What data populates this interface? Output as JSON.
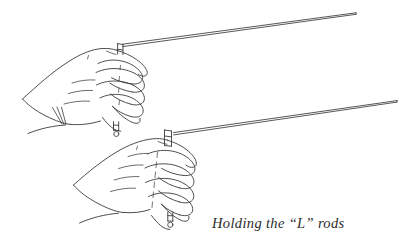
{
  "figure": {
    "caption": "Holding the “L” rods",
    "medium": "pen-and-ink line drawing",
    "background_color": "#ffffff",
    "ink_color": "#3a3a3a",
    "width": 419,
    "height": 250
  },
  "subjects": [
    {
      "name": "upper-hand",
      "description": "Left hand shown in profile, fingers curled into a loose fist gripping a vertical dowel handle; thumb hidden behind fingers, wrist and forearm exit to the lower left.",
      "grip": "closed fist, four fingers visible stacked vertically",
      "finger_count": 4
    },
    {
      "name": "lower-hand",
      "description": "Second hand below and to the right, also curled into a fist gripping a vertical dowel handle; four fingers visible, wrist exits to the lower left.",
      "grip": "closed fist, four fingers visible stacked vertically",
      "finger_count": 4
    }
  ],
  "objects": [
    {
      "name": "upper-l-rod",
      "description": "Dowsing rod bent in an L shape. Short vertical handle held inside the upper fist, long horizontal arm extending up and to the right toward the upper right corner.",
      "handle_orientation": "vertical",
      "arm_direction": "up and to the right"
    },
    {
      "name": "lower-l-rod",
      "description": "Second dowsing rod bent in an L shape. Short vertical handle held inside the lower fist, long horizontal arm extending up and to the right toward the right edge.",
      "handle_orientation": "vertical",
      "arm_direction": "up and to the right"
    }
  ],
  "labels": {
    "caption_text": "Holding the “L” rods"
  }
}
